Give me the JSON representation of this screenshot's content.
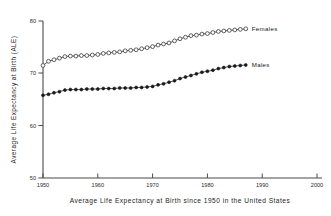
{
  "chart_data": {
    "type": "line",
    "title": "",
    "caption": "Average Life Expectancy at Birth since 1950 in the United States",
    "xlabel": "",
    "ylabel": "Average Life Expectancy at Birth (ALE)",
    "xlim": [
      1950,
      2000
    ],
    "ylim": [
      50,
      80
    ],
    "xticks": [
      1950,
      1960,
      1970,
      1980,
      1990,
      2000
    ],
    "xtick_labels": [
      "1950",
      "1960",
      "1970",
      "1980",
      "1990",
      "2000"
    ],
    "yticks": [
      50,
      60,
      70,
      80
    ],
    "ytick_labels": [
      "50",
      "60",
      "70",
      "80"
    ],
    "grid": false,
    "legend_position": "inline-right-of-series",
    "x": [
      1950,
      1951,
      1952,
      1953,
      1954,
      1955,
      1956,
      1957,
      1958,
      1959,
      1960,
      1961,
      1962,
      1963,
      1964,
      1965,
      1966,
      1967,
      1968,
      1969,
      1970,
      1971,
      1972,
      1973,
      1974,
      1975,
      1976,
      1977,
      1978,
      1979,
      1980,
      1981,
      1982,
      1983,
      1984,
      1985,
      1986,
      1987
    ],
    "series": [
      {
        "name": "Females",
        "marker": "open-circle",
        "values": [
          71.5,
          72.3,
          72.6,
          72.9,
          73.2,
          73.3,
          73.3,
          73.4,
          73.4,
          73.5,
          73.6,
          73.8,
          73.9,
          74.0,
          74.1,
          74.3,
          74.4,
          74.5,
          74.7,
          74.9,
          75.1,
          75.4,
          75.6,
          75.8,
          76.2,
          76.6,
          76.9,
          77.2,
          77.3,
          77.5,
          77.6,
          77.8,
          78.0,
          78.1,
          78.2,
          78.3,
          78.4,
          78.5
        ]
      },
      {
        "name": "Males",
        "marker": "filled-circle",
        "values": [
          65.8,
          66.0,
          66.3,
          66.5,
          66.8,
          66.9,
          66.9,
          66.9,
          67.0,
          67.0,
          67.0,
          67.1,
          67.1,
          67.1,
          67.2,
          67.2,
          67.2,
          67.3,
          67.3,
          67.4,
          67.5,
          67.8,
          68.0,
          68.3,
          68.6,
          69.0,
          69.3,
          69.6,
          69.9,
          70.2,
          70.4,
          70.6,
          70.9,
          71.1,
          71.3,
          71.4,
          71.5,
          71.6
        ]
      }
    ]
  },
  "labels": {
    "females": "Females",
    "males": "Males"
  },
  "axes": {
    "y_title": "Average Life Expectancy at Birth (ALE)",
    "caption": "Average Life Expectancy at Birth since 1950 in the United States"
  },
  "colors": {
    "line": "#3a3a3a",
    "axis": "#4a4a4a",
    "marker_fill_open": "#ffffff",
    "marker_fill_solid": "#1a1a1a",
    "background": "#ffffff"
  }
}
